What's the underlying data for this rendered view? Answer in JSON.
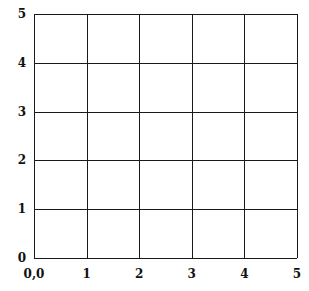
{
  "figure": {
    "title": "",
    "background_color": "#ffffff",
    "line_color": "#1a1a1a",
    "label_color": "#111111"
  },
  "chart_data": {
    "type": "grid",
    "title": "",
    "xlabel": "",
    "ylabel": "",
    "xlim": [
      0,
      5
    ],
    "ylim": [
      0,
      5
    ],
    "grid": true,
    "legend": null,
    "series": [],
    "values": [],
    "categories": [],
    "x_tick_labels": [
      "0,0",
      "1",
      "2",
      "3",
      "4",
      "5"
    ],
    "x_tick_values": [
      0,
      1,
      2,
      3,
      4,
      5
    ],
    "y_tick_labels": [
      "0",
      "1",
      "2",
      "3",
      "4",
      "5"
    ],
    "y_tick_values": [
      0,
      1,
      2,
      3,
      4,
      5
    ],
    "cells_x": 5,
    "cells_y": 5,
    "annotations": []
  }
}
